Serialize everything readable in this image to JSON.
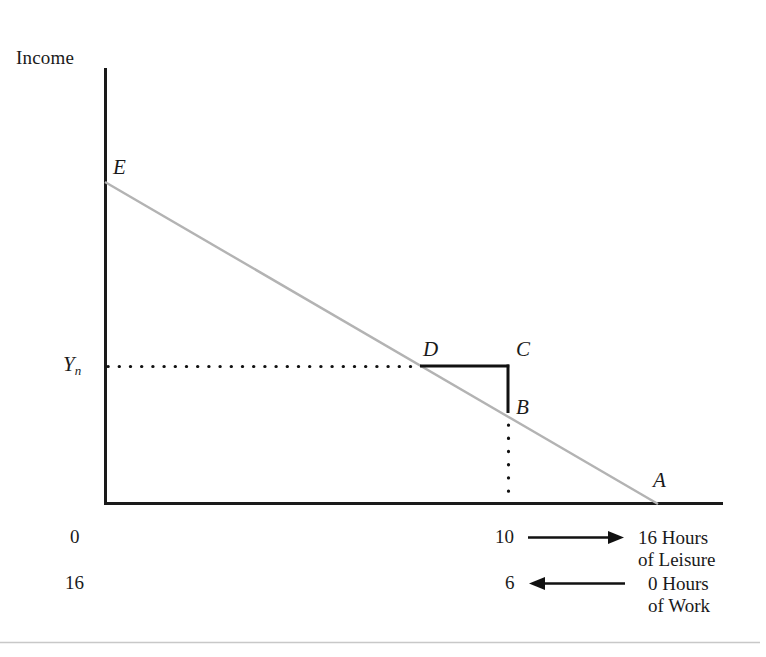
{
  "figure": {
    "axis_title": "Income",
    "colors": {
      "axis": "#1a1a1a",
      "budget_line": "#b3b3b3",
      "slope_triangle": "#111111",
      "dotted_guide": "#111111",
      "footer_rule": "#c8c8c8",
      "text": "#1a1a1a"
    },
    "points": [
      {
        "id": "E",
        "label": "E",
        "x": 105,
        "y": 182,
        "desc": "income intercept of budget line"
      },
      {
        "id": "D",
        "label": "D",
        "x": 421,
        "y": 366,
        "desc": "chosen bundle on budget line at Yn"
      },
      {
        "id": "C",
        "label": "C",
        "x": 508,
        "y": 366,
        "desc": "corner of slope triangle"
      },
      {
        "id": "B",
        "label": "B",
        "x": 508,
        "y": 412,
        "desc": "point on budget line below C"
      },
      {
        "id": "A",
        "label": "A",
        "x": 657,
        "y": 503,
        "desc": "leisure intercept of budget line"
      }
    ],
    "y_axis_label": {
      "text": "Y",
      "subscript": "n",
      "y": 366
    },
    "budget_line": {
      "from": "E",
      "to": "A"
    },
    "dotted_horizontal": {
      "from_x": 107,
      "to_x": 421,
      "y": 366
    },
    "dotted_vertical": {
      "x": 508,
      "from_y": 424,
      "to_y": 502
    },
    "slope_triangle": {
      "horizontal_from_x": 421,
      "horizontal_to_x": 508,
      "y": 366,
      "vertical_from_y": 366,
      "vertical_to_y": 412
    },
    "axes": {
      "origin_x": 104,
      "origin_y": 504,
      "top_y": 68,
      "right_x": 723
    },
    "scales": {
      "leisure": {
        "origin_tick": "0",
        "mid_tick": "10",
        "caption_line1": "16 Hours",
        "caption_line2": "of Leisure",
        "arrow_direction": "right"
      },
      "work": {
        "origin_tick": "16",
        "mid_tick": "6",
        "caption_line1": "0 Hours",
        "caption_line2": "of Work",
        "arrow_direction": "left"
      }
    }
  }
}
